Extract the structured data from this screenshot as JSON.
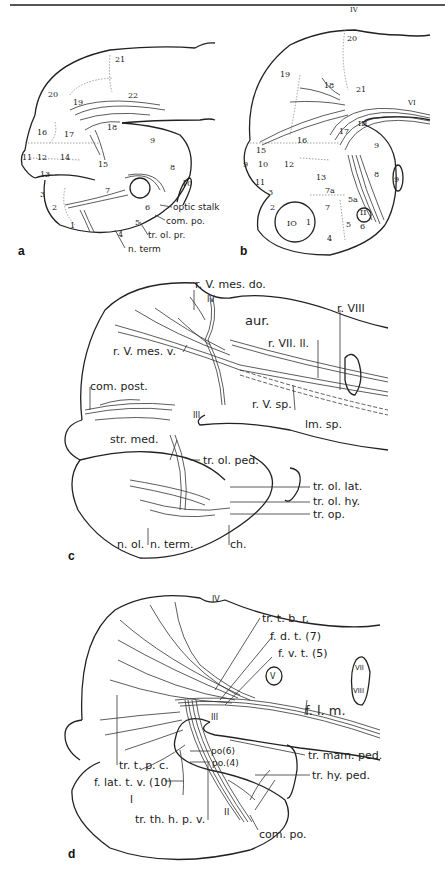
{
  "panels": {
    "a": {
      "letter": "a",
      "regions": [
        "1",
        "2",
        "3",
        "4",
        "5",
        "6",
        "7",
        "8",
        "9",
        "10",
        "11",
        "12",
        "13",
        "14",
        "15",
        "16",
        "17",
        "18",
        "19",
        "20",
        "21",
        "22"
      ],
      "labels": [
        "optic stalk",
        "com. po.",
        "tr. ol. pr.",
        "n. term"
      ]
    },
    "b": {
      "letter": "b",
      "regions": [
        "1",
        "2",
        "3",
        "4",
        "5",
        "6",
        "7",
        "7a",
        "8",
        "9",
        "10",
        "11",
        "12",
        "13",
        "14",
        "15",
        "16",
        "17",
        "18",
        "19",
        "20",
        "21",
        "22",
        "5a",
        "IO"
      ],
      "nerves": [
        "IV",
        "III",
        "II",
        "VI"
      ],
      "labels": []
    },
    "c": {
      "letter": "c",
      "labels": [
        "r. V. mes. do.",
        "IV",
        "aur.",
        "r. VIII",
        "r. VII. ll.",
        "r. V. mes. v.",
        "com. post.",
        "r. V. sp.",
        "lm. sp.",
        "III",
        "str. med.",
        "tr. ol. ped.",
        "tr. ol. lat.",
        "tr. ol. hy.",
        "tr. op.",
        "n. ol.",
        "n. term.",
        "ch."
      ]
    },
    "d": {
      "letter": "d",
      "labels": [
        "IV",
        "tr. t. b. r.",
        "f. d. t. (7)",
        "f. v. t. (5)",
        "V",
        "VII",
        "VIII",
        "III",
        "f. l. m.",
        "tr. mam. ped.",
        "po(6)",
        "po.(4)",
        "tr. t. p. c.",
        "tr. hy. ped.",
        "f. lat. t. v. (10)",
        "I",
        "tr. th. h. p. v.",
        "II",
        "com. po."
      ]
    }
  }
}
